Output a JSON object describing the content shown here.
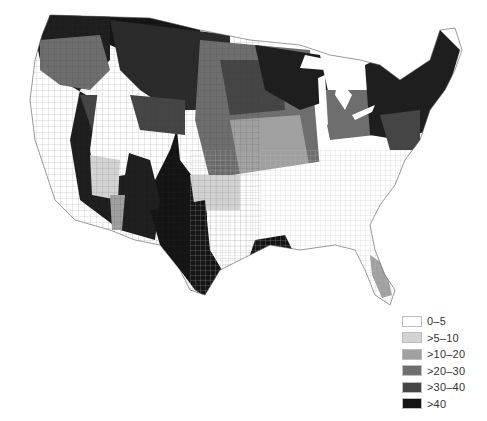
{
  "map": {
    "type": "choropleth",
    "region": "Contiguous United States (counties)",
    "legend": {
      "items": [
        {
          "label": "0–5",
          "color": "#ffffff"
        },
        {
          "label": ">5–10",
          "color": "#d3d3d3"
        },
        {
          "label": ">10–20",
          "color": "#a0a0a0"
        },
        {
          "label": ">20–30",
          "color": "#6e6e6e"
        },
        {
          "label": ">30–40",
          "color": "#454545"
        },
        {
          "label": ">40",
          "color": "#141414"
        }
      ]
    }
  }
}
